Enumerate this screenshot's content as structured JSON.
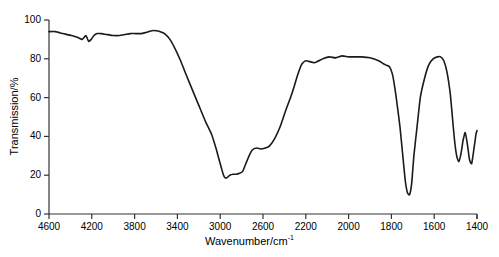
{
  "figure": {
    "background_color": "#ffffff",
    "line_color": "#1a1a1a",
    "axis_color": "#333333"
  },
  "axes": {
    "x_title_main": "Wavenumber/cm",
    "x_title_exponent": "-1",
    "y_title": "Transmission/%"
  },
  "chart_data": {
    "type": "line",
    "title": "",
    "xlabel": "Wavenumber/cm^-1",
    "ylabel": "Transmission/%",
    "grid": false,
    "legend": false,
    "x_axis_inverted": true,
    "x_axis_piecewise": true,
    "xlim": [
      4600,
      1400
    ],
    "ylim": [
      0,
      100
    ],
    "xticks": [
      4600,
      4200,
      3800,
      3400,
      3000,
      2600,
      2200,
      2000,
      1800,
      1600,
      1400
    ],
    "xtick_labels": [
      "4600",
      "4200",
      "3800",
      "3400",
      "3000",
      "2600",
      "2200",
      "2000",
      "1800",
      "1600",
      "1400"
    ],
    "yticks": [
      0,
      20,
      40,
      60,
      80,
      100
    ],
    "ytick_labels": [
      "0",
      "20",
      "40",
      "60",
      "80",
      "100"
    ],
    "series": [
      {
        "name": "IR transmission spectrum",
        "x": [
          4600,
          4540,
          4470,
          4390,
          4330,
          4290,
          4255,
          4230,
          4205,
          4180,
          4150,
          4110,
          4060,
          4000,
          3940,
          3890,
          3840,
          3790,
          3740,
          3700,
          3670,
          3640,
          3600,
          3560,
          3520,
          3470,
          3420,
          3370,
          3320,
          3260,
          3200,
          3140,
          3080,
          3040,
          3010,
          2990,
          2975,
          2960,
          2945,
          2930,
          2910,
          2880,
          2850,
          2820,
          2790,
          2760,
          2730,
          2700,
          2660,
          2620,
          2580,
          2540,
          2490,
          2440,
          2390,
          2330,
          2280,
          2240,
          2200,
          2160,
          2120,
          2090,
          2060,
          2030,
          2000,
          1970,
          1940,
          1900,
          1860,
          1830,
          1810,
          1795,
          1780,
          1760,
          1745,
          1735,
          1725,
          1715,
          1705,
          1695,
          1680,
          1665,
          1645,
          1625,
          1605,
          1585,
          1570,
          1555,
          1540,
          1525,
          1515,
          1505,
          1495,
          1485,
          1475,
          1465,
          1455,
          1445,
          1435,
          1425,
          1415,
          1405,
          1400
        ],
        "y": [
          94,
          94,
          93,
          92,
          91,
          90,
          92,
          89,
          90,
          92,
          93,
          93,
          92.5,
          92,
          92,
          92.5,
          93,
          93,
          93,
          93.5,
          94,
          94.5,
          94.5,
          94,
          93,
          90,
          85,
          79,
          72,
          64,
          56,
          48,
          41,
          34,
          28,
          24,
          21,
          19,
          18.5,
          19,
          20,
          20.5,
          20.5,
          21,
          22,
          26,
          30,
          33,
          34,
          33.5,
          34,
          35,
          39,
          45,
          53,
          62,
          71,
          77,
          79,
          78,
          80,
          81,
          80.5,
          81.5,
          81,
          81,
          81,
          80.5,
          79,
          77,
          76,
          72,
          62,
          45,
          28,
          17,
          11,
          10,
          16,
          30,
          45,
          60,
          70,
          77,
          80,
          81,
          81,
          79,
          73,
          62,
          50,
          38,
          30,
          27,
          31,
          38,
          42,
          36,
          28,
          26,
          33,
          41,
          43
        ],
        "annotations": [
          {
            "label": "broad O-H / C-H stretch band minimum",
            "x": 2960,
            "y": 18
          },
          {
            "label": "sharp C=O stretch minimum",
            "x": 1715,
            "y": 10
          },
          {
            "label": "fingerprint region oscillation",
            "x": 1455,
            "y": 27
          }
        ]
      }
    ]
  }
}
